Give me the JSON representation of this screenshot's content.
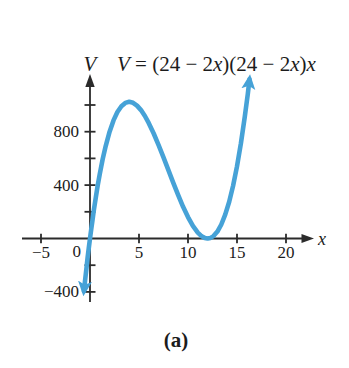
{
  "figure": {
    "caption": "(a)",
    "background_color": "#ffffff"
  },
  "chart_data": {
    "type": "line",
    "title": "",
    "equation_label": "V = (24 − 2x)(24 − 2x)x",
    "equation_parts": [
      "V",
      " = (24 ",
      "− 2",
      "x",
      ")(24 ",
      "− 2",
      "x",
      ")",
      "x"
    ],
    "function": "V = (24 − 2x)(24 − 2x)x",
    "x_axis": {
      "label": "x",
      "range_shown": [
        -7,
        23
      ],
      "origin_label": "0",
      "ticks": [
        {
          "x": -5,
          "label": "−5"
        },
        {
          "x": 5,
          "label": "5"
        },
        {
          "x": 10,
          "label": "10"
        },
        {
          "x": 15,
          "label": "15"
        },
        {
          "x": 20,
          "label": "20"
        }
      ]
    },
    "y_axis": {
      "label": "V",
      "range_shown": [
        -500,
        1250
      ],
      "tick_step": 200,
      "ticks": [
        {
          "v": 1000,
          "label": ""
        },
        {
          "v": 800,
          "label": "800"
        },
        {
          "v": 600,
          "label": ""
        },
        {
          "v": 400,
          "label": "400"
        },
        {
          "v": 200,
          "label": ""
        },
        {
          "v": -200,
          "label": ""
        },
        {
          "v": -400,
          "label": "−400"
        }
      ]
    },
    "key_points": {
      "x_intercepts": [
        0,
        12
      ],
      "local_max": {
        "x": 4,
        "V": 1024
      },
      "local_min": {
        "x": 12,
        "V": 0
      }
    },
    "points": [
      [
        -0.62,
        -395.0
      ],
      [
        -0.55,
        -346.5
      ],
      [
        -0.45,
        -279.0
      ],
      [
        -0.35,
        -213.5
      ],
      [
        -0.25,
        -150.1
      ],
      [
        -0.12,
        -70.5
      ],
      [
        0,
        0
      ],
      [
        0.12,
        67.7
      ],
      [
        0.25,
        138.1
      ],
      [
        0.4,
        215.3
      ],
      [
        0.6,
        311.9
      ],
      [
        0.8,
        401.4
      ],
      [
        1,
        484
      ],
      [
        1.3,
        595.3
      ],
      [
        1.6,
        692.2
      ],
      [
        2,
        800
      ],
      [
        2.4,
        884.7
      ],
      [
        2.8,
        947.9
      ],
      [
        3.2,
        991.2
      ],
      [
        3.6,
        1016.1
      ],
      [
        4,
        1024
      ],
      [
        4.4,
        1016.6
      ],
      [
        4.8,
        995.3
      ],
      [
        5.2,
        961.8
      ],
      [
        5.6,
        917.5
      ],
      [
        6,
        864
      ],
      [
        6.5,
        786.5
      ],
      [
        7,
        700
      ],
      [
        7.5,
        607.5
      ],
      [
        8,
        512
      ],
      [
        8.5,
        416.5
      ],
      [
        9,
        324
      ],
      [
        9.5,
        237.5
      ],
      [
        10,
        160
      ],
      [
        10.5,
        94.5
      ],
      [
        11,
        44
      ],
      [
        11.4,
        16.4
      ],
      [
        11.7,
        4.2
      ],
      [
        12,
        0
      ],
      [
        12.3,
        4.4
      ],
      [
        12.6,
        18.1
      ],
      [
        13,
        52
      ],
      [
        13.4,
        105.1
      ],
      [
        13.8,
        178.8
      ],
      [
        14.2,
        274.9
      ],
      [
        14.6,
        394.8
      ],
      [
        15,
        540
      ],
      [
        15.4,
        712.1
      ],
      [
        15.8,
        912.6
      ],
      [
        16.1,
        1082.6
      ],
      [
        16.28,
        1192.9
      ]
    ],
    "legend": null,
    "grid": false,
    "style": {
      "curve_color": "#46a2d7",
      "axis_color": "#2b2b2b",
      "text_color": "#1c1c1c",
      "curve_width": 4.6
    }
  }
}
